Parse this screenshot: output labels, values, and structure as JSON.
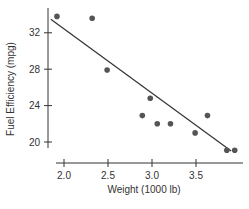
{
  "chart_data": {
    "type": "scatter",
    "title": "",
    "xlabel": "Weight (1000 lb)",
    "ylabel": "Fuel Efficiency (mpg)",
    "xlim": [
      1.82,
      3.98
    ],
    "ylim": [
      18.5,
      34.8
    ],
    "xticks": [
      2.0,
      2.5,
      3.0,
      3.5
    ],
    "xtick_labels": [
      "2.0",
      "2.5",
      "3.0",
      "3.5"
    ],
    "yticks": [
      20,
      24,
      28,
      32
    ],
    "ytick_labels": [
      "20",
      "24",
      "28",
      "32"
    ],
    "grid": false,
    "legend": null,
    "points": [
      {
        "x": 1.92,
        "y": 33.8
      },
      {
        "x": 2.32,
        "y": 33.6
      },
      {
        "x": 2.49,
        "y": 27.9
      },
      {
        "x": 2.89,
        "y": 22.9
      },
      {
        "x": 2.98,
        "y": 24.8
      },
      {
        "x": 3.06,
        "y": 22.0
      },
      {
        "x": 3.21,
        "y": 22.0
      },
      {
        "x": 3.49,
        "y": 21.0
      },
      {
        "x": 3.63,
        "y": 22.9
      },
      {
        "x": 3.85,
        "y": 19.1
      },
      {
        "x": 3.94,
        "y": 19.1
      }
    ],
    "regression_line": {
      "x1": 1.85,
      "y1": 33.5,
      "x2": 3.9,
      "y2": 19.0
    },
    "colors": {
      "points": "#555555",
      "line": "#333333",
      "axis": "#333333"
    }
  }
}
